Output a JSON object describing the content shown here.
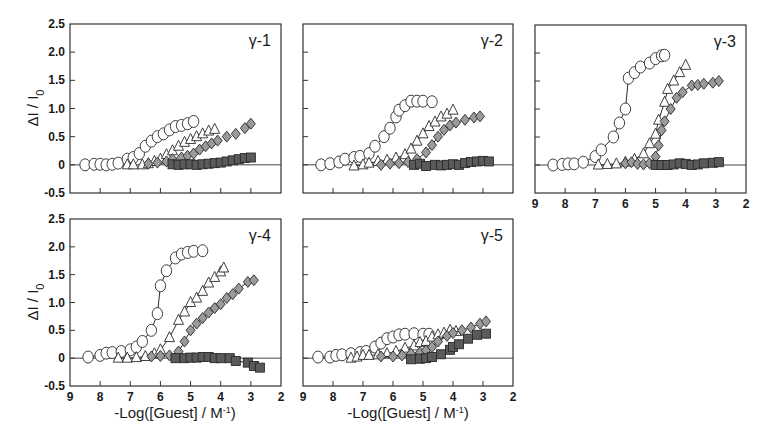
{
  "figure": {
    "ylabel": "ΔI / I",
    "ylabel_sub": "0",
    "xlabel": "-Log([Guest] / M",
    "xlabel_sup": "-1",
    "xlabel_close": ")"
  },
  "colors": {
    "frame": "#333333",
    "zero_line": "#444444",
    "circle_fill": "#ffffff",
    "triangle_fill": "#ffffff",
    "diamond_fill": "#9a9a9a",
    "square_fill": "#5a5a5a",
    "marker_stroke": "#2a2a2a",
    "connector": "#2a2a2a"
  },
  "chart_data": [
    {
      "type": "scatter",
      "title": "γ-1",
      "xlabel": "-Log([Guest] / M-1)",
      "ylabel": "ΔI / I0",
      "xlim": [
        9,
        2
      ],
      "ylim": [
        -0.5,
        2.5
      ],
      "xticks": [
        9,
        8,
        7,
        6,
        5,
        4,
        3,
        2
      ],
      "yticks": [
        "-0.5",
        "0",
        "0.5",
        "1.0",
        "1.5",
        "2.0",
        "2.5"
      ],
      "show_xtick_labels": false,
      "show_ytick_labels": true,
      "grid": false,
      "legend": "none",
      "series": [
        {
          "name": "circle",
          "marker": "circle",
          "connected": false,
          "x": [
            8.5,
            8.2,
            8.0,
            7.8,
            7.6,
            7.4,
            7.1,
            6.9,
            6.7,
            6.5,
            6.3,
            6.1,
            5.9,
            5.7,
            5.5,
            5.3,
            5.1,
            4.9
          ],
          "y": [
            0.0,
            0.01,
            0.01,
            0.0,
            0.01,
            0.03,
            0.1,
            0.13,
            0.2,
            0.33,
            0.42,
            0.5,
            0.55,
            0.62,
            0.68,
            0.7,
            0.73,
            0.77
          ]
        },
        {
          "name": "triangle",
          "marker": "triangle",
          "connected": false,
          "x": [
            7.1,
            6.9,
            6.6,
            6.4,
            6.2,
            6.0,
            5.8,
            5.6,
            5.4,
            5.2,
            5.0,
            4.8,
            4.6,
            4.4,
            4.2
          ],
          "y": [
            0.0,
            0.0,
            0.0,
            0.02,
            0.06,
            0.1,
            0.18,
            0.25,
            0.33,
            0.4,
            0.45,
            0.5,
            0.55,
            0.6,
            0.63
          ]
        },
        {
          "name": "diamond",
          "marker": "diamond",
          "connected": false,
          "x": [
            6.4,
            6.1,
            5.8,
            5.6,
            5.3,
            5.1,
            4.9,
            4.7,
            4.5,
            4.3,
            4.1,
            3.8,
            3.5,
            3.2,
            3.0
          ],
          "y": [
            0.02,
            0.04,
            0.06,
            0.1,
            0.13,
            0.16,
            0.2,
            0.27,
            0.33,
            0.38,
            0.43,
            0.5,
            0.55,
            0.65,
            0.73
          ]
        },
        {
          "name": "square",
          "marker": "square",
          "connected": false,
          "x": [
            5.6,
            5.4,
            5.2,
            5.0,
            4.8,
            4.6,
            4.4,
            4.2,
            4.0,
            3.8,
            3.6,
            3.4,
            3.2,
            3.0
          ],
          "y": [
            0.01,
            0.0,
            0.01,
            0.01,
            0.0,
            0.01,
            0.02,
            0.03,
            0.04,
            0.06,
            0.08,
            0.1,
            0.12,
            0.13
          ]
        }
      ]
    },
    {
      "type": "scatter",
      "title": "γ-2",
      "xlabel": "-Log([Guest] / M-1)",
      "ylabel": "ΔI / I0",
      "xlim": [
        9,
        2
      ],
      "ylim": [
        -0.5,
        2.5
      ],
      "xticks": [
        9,
        8,
        7,
        6,
        5,
        4,
        3,
        2
      ],
      "yticks": [
        "-0.5",
        "0",
        "0.5",
        "1.0",
        "1.5",
        "2.0",
        "2.5"
      ],
      "show_xtick_labels": false,
      "show_ytick_labels": false,
      "grid": false,
      "legend": "none",
      "series": [
        {
          "name": "circle",
          "marker": "circle",
          "connected": true,
          "x": [
            8.4,
            8.1,
            7.8,
            7.6,
            7.3,
            7.1,
            6.8,
            6.6,
            6.3,
            6.1,
            5.9,
            5.8,
            5.6,
            5.4,
            5.2,
            5.0,
            4.7
          ],
          "y": [
            0.0,
            0.02,
            0.05,
            0.1,
            0.13,
            0.15,
            0.2,
            0.33,
            0.5,
            0.65,
            0.85,
            0.97,
            1.05,
            1.13,
            1.13,
            1.13,
            1.12
          ]
        },
        {
          "name": "triangle",
          "marker": "triangle",
          "connected": true,
          "x": [
            7.3,
            7.0,
            6.8,
            6.5,
            6.2,
            5.9,
            5.6,
            5.4,
            5.2,
            5.0,
            4.8,
            4.6,
            4.4,
            4.2,
            4.0
          ],
          "y": [
            -0.02,
            0.0,
            0.03,
            0.06,
            0.08,
            0.12,
            0.18,
            0.28,
            0.42,
            0.55,
            0.68,
            0.76,
            0.85,
            0.9,
            0.97
          ]
        },
        {
          "name": "diamond",
          "marker": "diamond",
          "connected": true,
          "x": [
            6.4,
            6.1,
            5.8,
            5.5,
            5.2,
            4.9,
            4.7,
            4.5,
            4.3,
            4.1,
            3.9,
            3.6,
            3.3,
            3.1
          ],
          "y": [
            0.0,
            0.02,
            0.03,
            0.05,
            0.1,
            0.22,
            0.35,
            0.5,
            0.62,
            0.7,
            0.75,
            0.8,
            0.84,
            0.86
          ]
        },
        {
          "name": "square",
          "marker": "square",
          "connected": true,
          "x": [
            5.3,
            5.1,
            4.9,
            4.6,
            4.4,
            4.2,
            4.0,
            3.8,
            3.6,
            3.4,
            3.2,
            3.0,
            2.8
          ],
          "y": [
            0.0,
            0.02,
            -0.02,
            0.0,
            -0.01,
            0.0,
            0.01,
            0.0,
            0.03,
            0.05,
            0.06,
            0.07,
            0.06
          ]
        }
      ]
    },
    {
      "type": "scatter",
      "title": "γ-3",
      "xlabel": "-Log([Guest] / M-1)",
      "ylabel": "ΔI / I0",
      "xlim": [
        9,
        2
      ],
      "ylim": [
        -0.5,
        2.5
      ],
      "xticks": [
        9,
        8,
        7,
        6,
        5,
        4,
        3,
        2
      ],
      "yticks": [
        "-0.5",
        "0",
        "0.5",
        "1.0",
        "1.5",
        "2.0",
        "2.5"
      ],
      "show_xtick_labels": true,
      "show_ytick_labels": false,
      "grid": false,
      "legend": "none",
      "series": [
        {
          "name": "circle",
          "marker": "circle",
          "connected": true,
          "x": [
            8.4,
            8.1,
            7.9,
            7.7,
            7.4,
            7.0,
            6.8,
            6.4,
            6.2,
            6.0,
            5.9,
            5.7,
            5.5,
            5.2,
            5.0,
            4.8,
            4.7
          ],
          "y": [
            0.0,
            0.01,
            0.02,
            0.02,
            0.05,
            0.15,
            0.27,
            0.5,
            0.75,
            1.0,
            1.55,
            1.65,
            1.75,
            1.82,
            1.9,
            1.95,
            1.96
          ]
        },
        {
          "name": "triangle",
          "marker": "triangle",
          "connected": true,
          "x": [
            6.9,
            6.6,
            6.3,
            6.0,
            5.7,
            5.4,
            5.2,
            5.0,
            4.9,
            4.7,
            4.6,
            4.4,
            4.2,
            4.0
          ],
          "y": [
            0.0,
            0.01,
            0.02,
            0.05,
            0.1,
            0.2,
            0.38,
            0.55,
            0.8,
            1.12,
            1.35,
            1.5,
            1.65,
            1.78
          ]
        },
        {
          "name": "diamond",
          "marker": "diamond",
          "connected": true,
          "x": [
            6.0,
            5.8,
            5.6,
            5.4,
            5.2,
            5.0,
            4.9,
            4.8,
            4.7,
            4.5,
            4.3,
            4.1,
            3.8,
            3.6,
            3.4,
            3.1,
            2.9
          ],
          "y": [
            0.03,
            0.05,
            0.02,
            0.01,
            0.03,
            0.15,
            0.35,
            0.62,
            0.78,
            1.0,
            1.2,
            1.3,
            1.42,
            1.43,
            1.45,
            1.47,
            1.5
          ]
        },
        {
          "name": "square",
          "marker": "square",
          "connected": true,
          "x": [
            5.0,
            4.8,
            4.6,
            4.4,
            4.2,
            4.0,
            3.8,
            3.6,
            3.4,
            3.1,
            2.9
          ],
          "y": [
            0.0,
            0.0,
            0.0,
            0.01,
            0.03,
            0.02,
            0.0,
            0.01,
            0.03,
            0.04,
            0.05
          ]
        }
      ]
    },
    {
      "type": "scatter",
      "title": "γ-4",
      "xlabel": "-Log([Guest] / M-1)",
      "ylabel": "ΔI / I0",
      "xlim": [
        9,
        2
      ],
      "ylim": [
        -0.5,
        2.5
      ],
      "xticks": [
        9,
        8,
        7,
        6,
        5,
        4,
        3,
        2
      ],
      "yticks": [
        "-0.5",
        "0",
        "0.5",
        "1.0",
        "1.5",
        "2.0",
        "2.5"
      ],
      "show_xtick_labels": true,
      "show_ytick_labels": true,
      "grid": false,
      "legend": "none",
      "series": [
        {
          "name": "circle",
          "marker": "circle",
          "connected": true,
          "x": [
            8.4,
            8.0,
            7.8,
            7.6,
            7.3,
            7.0,
            6.8,
            6.6,
            6.3,
            6.1,
            6.0,
            5.8,
            5.5,
            5.3,
            5.1,
            4.9,
            4.6
          ],
          "y": [
            0.02,
            0.05,
            0.09,
            0.1,
            0.12,
            0.15,
            0.2,
            0.3,
            0.5,
            0.8,
            1.3,
            1.57,
            1.8,
            1.87,
            1.9,
            1.92,
            1.93
          ]
        },
        {
          "name": "triangle",
          "marker": "triangle",
          "connected": true,
          "x": [
            7.4,
            7.1,
            6.8,
            6.5,
            6.2,
            6.0,
            5.7,
            5.4,
            5.2,
            5.0,
            4.8,
            4.6,
            4.4,
            4.2,
            4.0,
            3.9
          ],
          "y": [
            0.0,
            0.0,
            0.01,
            0.03,
            0.08,
            0.15,
            0.37,
            0.68,
            0.83,
            1.0,
            1.08,
            1.2,
            1.35,
            1.45,
            1.55,
            1.62
          ]
        },
        {
          "name": "diamond",
          "marker": "diamond",
          "connected": true,
          "x": [
            6.3,
            6.0,
            5.7,
            5.4,
            5.2,
            5.0,
            4.8,
            4.6,
            4.4,
            4.2,
            4.0,
            3.8,
            3.6,
            3.4,
            3.1,
            2.9
          ],
          "y": [
            0.03,
            0.04,
            0.05,
            0.12,
            0.3,
            0.5,
            0.62,
            0.72,
            0.82,
            0.9,
            0.97,
            1.08,
            1.15,
            1.25,
            1.37,
            1.4
          ]
        },
        {
          "name": "square",
          "marker": "square",
          "connected": true,
          "x": [
            5.5,
            5.2,
            5.0,
            4.8,
            4.6,
            4.4,
            4.2,
            4.0,
            3.7,
            3.5,
            3.1,
            2.9,
            2.7
          ],
          "y": [
            0.0,
            0.0,
            0.01,
            0.01,
            0.02,
            0.02,
            0.0,
            0.0,
            0.0,
            -0.05,
            -0.08,
            -0.14,
            -0.17
          ]
        }
      ]
    },
    {
      "type": "scatter",
      "title": "γ-5",
      "xlabel": "-Log([Guest] / M-1)",
      "ylabel": "ΔI / I0",
      "xlim": [
        9,
        2
      ],
      "ylim": [
        -0.5,
        2.5
      ],
      "xticks": [
        9,
        8,
        7,
        6,
        5,
        4,
        3,
        2
      ],
      "yticks": [
        "-0.5",
        "0",
        "0.5",
        "1.0",
        "1.5",
        "2.0",
        "2.5"
      ],
      "show_xtick_labels": true,
      "show_ytick_labels": false,
      "grid": false,
      "legend": "none",
      "series": [
        {
          "name": "circle",
          "marker": "circle",
          "connected": true,
          "x": [
            8.5,
            8.1,
            7.9,
            7.7,
            7.4,
            7.1,
            6.9,
            6.6,
            6.4,
            6.2,
            6.0,
            5.8,
            5.6,
            5.3,
            5.0,
            4.8
          ],
          "y": [
            0.02,
            0.02,
            0.05,
            0.06,
            0.08,
            0.1,
            0.12,
            0.2,
            0.27,
            0.35,
            0.38,
            0.42,
            0.43,
            0.44,
            0.43,
            0.43
          ]
        },
        {
          "name": "triangle",
          "marker": "triangle",
          "connected": true,
          "x": [
            7.4,
            7.2,
            7.0,
            6.8,
            6.5,
            6.2,
            5.9,
            5.6,
            5.3,
            5.1,
            4.9,
            4.7,
            4.5,
            4.3,
            4.1,
            3.9
          ],
          "y": [
            0.0,
            0.02,
            0.05,
            0.05,
            0.06,
            0.08,
            0.12,
            0.18,
            0.22,
            0.28,
            0.3,
            0.38,
            0.42,
            0.45,
            0.5,
            0.48
          ]
        },
        {
          "name": "diamond",
          "marker": "diamond",
          "connected": true,
          "x": [
            6.4,
            6.0,
            5.7,
            5.4,
            5.1,
            4.9,
            4.7,
            4.5,
            4.2,
            4.0,
            3.7,
            3.4,
            3.1,
            2.9
          ],
          "y": [
            0.03,
            0.03,
            0.05,
            0.08,
            0.1,
            0.14,
            0.2,
            0.3,
            0.4,
            0.45,
            0.5,
            0.55,
            0.62,
            0.66
          ]
        },
        {
          "name": "square",
          "marker": "square",
          "connected": true,
          "x": [
            5.4,
            5.1,
            4.9,
            4.7,
            4.4,
            4.1,
            4.0,
            3.8,
            3.5,
            3.2,
            2.9
          ],
          "y": [
            -0.02,
            -0.01,
            0.0,
            0.02,
            0.07,
            0.15,
            0.2,
            0.25,
            0.35,
            0.42,
            0.44
          ]
        }
      ]
    }
  ],
  "layout": {
    "panels": [
      {
        "left": 70,
        "top": 24,
        "right": 281,
        "bottom": 193
      },
      {
        "left": 303,
        "top": 24,
        "right": 513,
        "bottom": 193
      },
      {
        "left": 535,
        "top": 25,
        "right": 746,
        "bottom": 193
      },
      {
        "left": 70,
        "top": 219,
        "right": 281,
        "bottom": 386
      },
      {
        "left": 303,
        "top": 219,
        "right": 513,
        "bottom": 386
      }
    ],
    "ylabel_positions": [
      {
        "x": 38,
        "y": 108
      },
      {
        "x": 38,
        "y": 302
      }
    ],
    "xlabel_positions": [
      {
        "x": 175,
        "y": 418
      },
      {
        "x": 408,
        "y": 418
      }
    ]
  }
}
